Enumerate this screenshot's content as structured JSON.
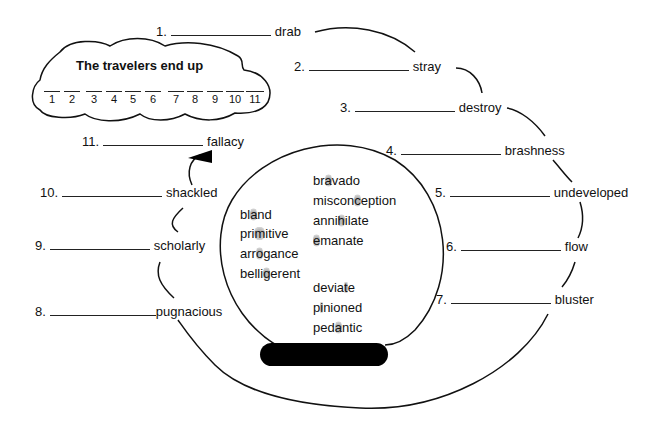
{
  "puzzle": {
    "cloud": {
      "title": "The travelers end up",
      "slots": [
        "1",
        "2",
        "3",
        "4",
        "5",
        "6",
        "7",
        "8",
        "9",
        "10",
        "11"
      ]
    },
    "clues": [
      {
        "num": "1.",
        "word": "drab"
      },
      {
        "num": "2.",
        "word": "stray"
      },
      {
        "num": "3.",
        "word": "destroy"
      },
      {
        "num": "4.",
        "word": "brashness"
      },
      {
        "num": "5.",
        "word": "undeveloped"
      },
      {
        "num": "6.",
        "word": "flow"
      },
      {
        "num": "7.",
        "word": "bluster"
      },
      {
        "num": "8.",
        "word": "pugnacious"
      },
      {
        "num": "9.",
        "word": "scholarly"
      },
      {
        "num": "10.",
        "word": "shackled"
      },
      {
        "num": "11.",
        "word": "fallacy"
      }
    ],
    "word_bank": {
      "left": [
        {
          "pre": "bl",
          "hl": "a",
          "post": "nd"
        },
        {
          "pre": "pri",
          "hl": "m",
          "post": "itive"
        },
        {
          "pre": "arr",
          "hl": "o",
          "post": "gance"
        },
        {
          "pre": "belli",
          "hl": "g",
          "post": "erent"
        }
      ],
      "right_top": [
        {
          "pre": "br",
          "hl": "a",
          "post": "vado"
        },
        {
          "pre": "miscon",
          "hl": "c",
          "post": "eption"
        },
        {
          "pre": "anni",
          "hl": "h",
          "post": "ilate"
        },
        {
          "pre": "",
          "hl": "e",
          "post": "manate"
        }
      ],
      "right_bottom": [
        {
          "pre": "devia",
          "hl": "t",
          "post": "e"
        },
        {
          "pre": "p",
          "hl": "i",
          "post": "nioned"
        },
        {
          "pre": "ped",
          "hl": "a",
          "post": "ntic"
        }
      ]
    }
  }
}
